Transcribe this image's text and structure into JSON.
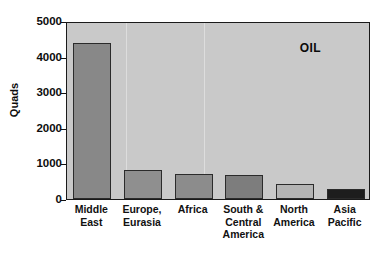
{
  "chart_data": {
    "type": "bar",
    "title": "",
    "annotation": "OIL",
    "xlabel": "",
    "ylabel": "Quads",
    "ylim": [
      0,
      5000
    ],
    "yticks": [
      0,
      1000,
      2000,
      3000,
      4000,
      5000
    ],
    "ytick_labels": [
      "0",
      "1000",
      "2000",
      "3000",
      "4000",
      "5000"
    ],
    "grid": false,
    "legend": "none",
    "categories": [
      "Middle\nEast",
      "Europe,\nEurasia",
      "Africa",
      "South &\nCentral\nAmerica",
      "North\nAmerica",
      "Asia\nPacific"
    ],
    "values": [
      4380,
      830,
      690,
      680,
      420,
      270
    ],
    "bar_colors": [
      "#888888",
      "#8f8f8f",
      "#8c8c8c",
      "#7d7d7d",
      "#b4b4b4",
      "#1d1d1d"
    ],
    "plot_background": "#c9c9c9",
    "axis_color": "#1a1a1a"
  },
  "ticks": [
    {
      "label": "5000",
      "value": 5000
    },
    {
      "label": "4000",
      "value": 4000
    },
    {
      "label": "3000",
      "value": 3000
    },
    {
      "label": "2000",
      "value": 2000
    },
    {
      "label": "1000",
      "value": 1000
    },
    {
      "label": "0",
      "value": 0
    }
  ],
  "bars": [
    {
      "label": "Middle\nEast",
      "value": 4380,
      "color": "#888888"
    },
    {
      "label": "Europe,\nEurasia",
      "value": 830,
      "color": "#8f8f8f"
    },
    {
      "label": "Africa",
      "value": 690,
      "color": "#8c8c8c"
    },
    {
      "label": "South &\nCentral\nAmerica",
      "value": 680,
      "color": "#7d7d7d"
    },
    {
      "label": "North\nAmerica",
      "value": 420,
      "color": "#b4b4b4"
    },
    {
      "label": "Asia\nPacific",
      "value": 270,
      "color": "#1d1d1d"
    }
  ],
  "axis": {
    "y_title": "Quads"
  },
  "annotation": {
    "oil": "OIL"
  }
}
